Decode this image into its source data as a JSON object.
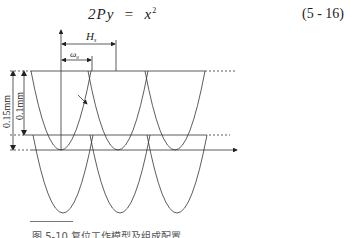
{
  "equation": {
    "lhs": "2Py",
    "equals": "=",
    "rhs_base": "x",
    "rhs_exp": "2",
    "number": "(5 - 16)"
  },
  "figure": {
    "labels": {
      "pitch": "H",
      "pitch_sub": "s",
      "half": "ω",
      "half_sub": "0",
      "dim_outer": "0.15mm",
      "dim_inner": "0.1mm"
    },
    "upper_parabola_vertices_x": [
      61,
      118,
      175
    ],
    "lower_parabola_vertices_x": [
      63,
      120,
      177
    ],
    "line_color": "#333333"
  },
  "caption": {
    "text": "图 5-10  复位工作模型及组成配置"
  }
}
